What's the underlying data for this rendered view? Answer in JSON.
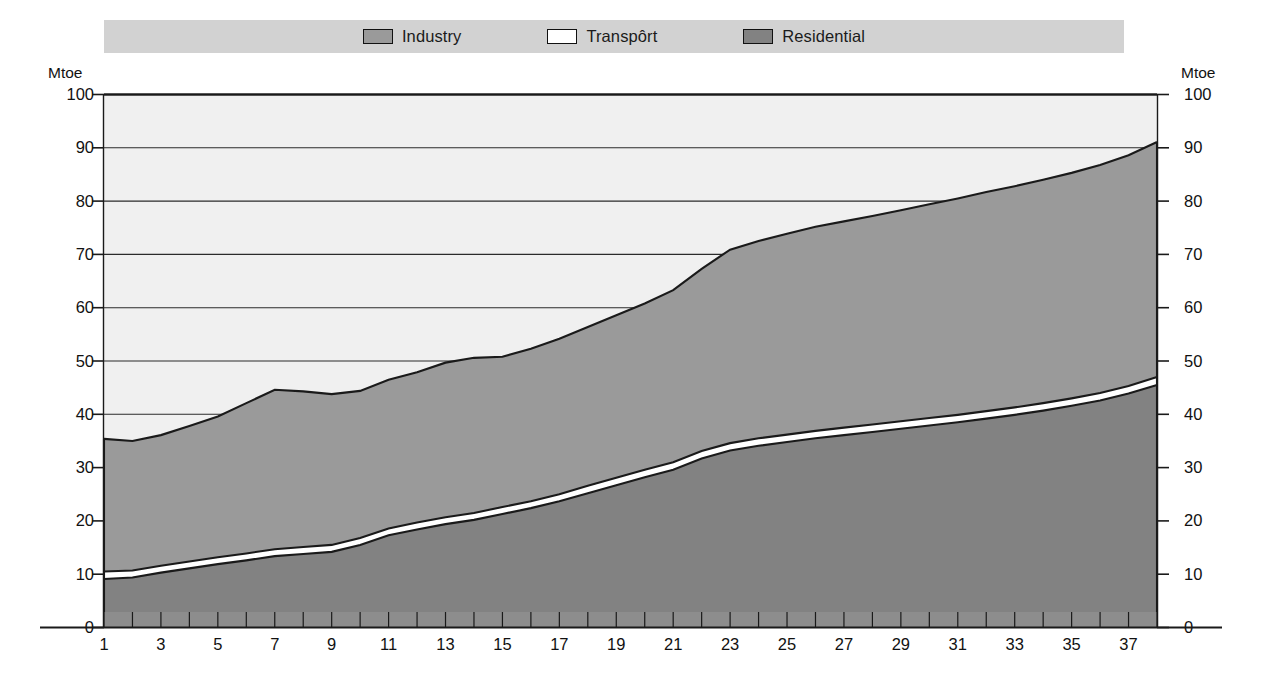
{
  "legend": {
    "items": [
      {
        "label": "Industry",
        "color": "#9a9a9a",
        "name": "legend-swatch-industry"
      },
      {
        "label": "Transpôrt",
        "color": "#ffffff",
        "name": "legend-swatch-transport"
      },
      {
        "label": "Residential",
        "color": "#828282",
        "name": "legend-swatch-residential"
      }
    ],
    "band_color": "#d2d2d2"
  },
  "axes": {
    "y_unit_left": "Mtoe",
    "y_unit_right": "Mtoe",
    "y_ticks": [
      0,
      10,
      20,
      30,
      40,
      50,
      60,
      70,
      80,
      90,
      100
    ],
    "y_min": 0,
    "y_max": 100,
    "x_ticks": [
      1,
      3,
      5,
      7,
      9,
      11,
      13,
      15,
      17,
      19,
      21,
      23,
      25,
      27,
      29,
      31,
      33,
      35,
      37
    ],
    "x_min": 1,
    "x_max": 38
  },
  "chart_data": {
    "type": "area",
    "title": "",
    "xlabel": "",
    "ylabel": "Mtoe",
    "ylim": [
      0,
      100
    ],
    "xlim": [
      1,
      38
    ],
    "grid": true,
    "stacked": true,
    "legend_position": "top",
    "x": [
      1,
      2,
      3,
      4,
      5,
      6,
      7,
      8,
      9,
      10,
      11,
      12,
      13,
      14,
      15,
      16,
      17,
      18,
      19,
      20,
      21,
      22,
      23,
      24,
      25,
      26,
      27,
      28,
      29,
      30,
      31,
      32,
      33,
      34,
      35,
      36,
      37,
      38
    ],
    "series": [
      {
        "name": "Residential",
        "color": "#828282",
        "values": [
          9.0,
          9.3,
          10.2,
          11.0,
          11.8,
          12.5,
          13.3,
          13.7,
          14.1,
          15.4,
          17.2,
          18.3,
          19.3,
          20.1,
          21.2,
          22.3,
          23.6,
          25.1,
          26.6,
          28.1,
          29.5,
          31.6,
          33.1,
          34.0,
          34.7,
          35.4,
          36.0,
          36.6,
          37.2,
          37.8,
          38.4,
          39.1,
          39.8,
          40.6,
          41.5,
          42.5,
          43.8,
          45.4
        ]
      },
      {
        "name": "Transport",
        "color": "#ffffff",
        "values": [
          1.4,
          1.3,
          1.3,
          1.3,
          1.3,
          1.3,
          1.3,
          1.3,
          1.3,
          1.3,
          1.3,
          1.3,
          1.3,
          1.3,
          1.3,
          1.3,
          1.3,
          1.4,
          1.4,
          1.4,
          1.4,
          1.4,
          1.4,
          1.4,
          1.4,
          1.4,
          1.4,
          1.4,
          1.4,
          1.4,
          1.4,
          1.4,
          1.4,
          1.4,
          1.4,
          1.4,
          1.4,
          1.5
        ]
      },
      {
        "name": "Industry",
        "color": "#9a9a9a",
        "values": [
          24.9,
          24.3,
          24.5,
          25.4,
          26.4,
          28.2,
          29.9,
          29.2,
          28.3,
          27.6,
          27.9,
          28.2,
          29.0,
          29.1,
          28.2,
          28.6,
          29.2,
          29.8,
          30.5,
          31.2,
          32.3,
          34.2,
          36.3,
          37.0,
          37.7,
          38.3,
          38.7,
          39.1,
          39.6,
          40.1,
          40.6,
          41.1,
          41.5,
          41.9,
          42.3,
          42.8,
          43.3,
          44.1
        ]
      }
    ],
    "totals": [
      35.3,
      34.9,
      36.0,
      37.7,
      39.5,
      42.0,
      44.5,
      44.2,
      43.7,
      44.3,
      46.4,
      47.8,
      49.6,
      50.5,
      50.7,
      52.2,
      54.1,
      56.3,
      58.5,
      60.7,
      63.2,
      67.2,
      70.8,
      72.4,
      73.8,
      75.1,
      76.1,
      77.1,
      78.2,
      79.3,
      80.4,
      81.6,
      82.7,
      83.9,
      85.2,
      86.7,
      88.5,
      91.0
    ]
  }
}
